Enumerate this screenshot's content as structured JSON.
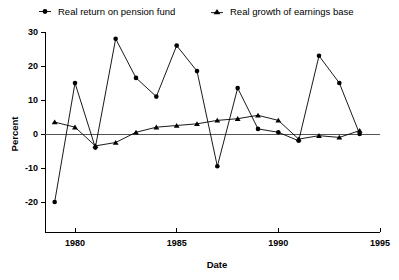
{
  "chart_data": {
    "type": "line",
    "title": "",
    "xlabel": "Date",
    "ylabel": "Percent",
    "xlim": [
      1978.2,
      1995.4
    ],
    "ylim": [
      -22,
      31
    ],
    "grid": false,
    "legend_position": "top",
    "x_ticks": [
      1980,
      1985,
      1990,
      1995
    ],
    "x_tick_labels": [
      "1980",
      "1985",
      "1990",
      "1995"
    ],
    "y_ticks": [
      -20,
      -10,
      0,
      10,
      20,
      30
    ],
    "y_tick_labels": [
      "-20",
      "-10",
      "0",
      "10",
      "20",
      "30"
    ],
    "x": [
      1979,
      1980,
      1981,
      1982,
      1983,
      1984,
      1985,
      1986,
      1987,
      1988,
      1989,
      1990,
      1991,
      1992,
      1993,
      1994
    ],
    "series": [
      {
        "name": "Real return on pension fund",
        "marker": "circle",
        "values": [
          -20,
          15,
          -4,
          28,
          16.5,
          11,
          26,
          18.5,
          -9.5,
          13.5,
          1.5,
          0.5,
          -2,
          23,
          15,
          0
        ]
      },
      {
        "name": "Real growth of earnings base",
        "marker": "triangle",
        "values": [
          3.5,
          2,
          -3.5,
          -2.5,
          0.5,
          2,
          2.5,
          3,
          4,
          4.5,
          5.5,
          4,
          -1.5,
          -0.5,
          -1,
          1
        ]
      }
    ]
  },
  "legend": {
    "entries": [
      {
        "label": "Real return on pension fund",
        "marker": "circle-marker-icon"
      },
      {
        "label": "Real growth of earnings base",
        "marker": "triangle-marker-icon"
      }
    ]
  },
  "axes": {
    "y_title": "Percent",
    "x_title": "Date"
  },
  "colors": {
    "ink": "#000000",
    "zero_line": "#555555",
    "background": "#ffffff"
  }
}
